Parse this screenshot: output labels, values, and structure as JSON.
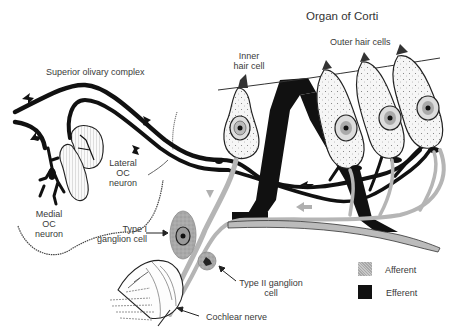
{
  "title": "Organ of Corti",
  "labels": {
    "superior_olivary_complex": "Superior olivary complex",
    "inner_hair_cell_line1": "Inner",
    "inner_hair_cell_line2": "hair cell",
    "outer_hair_cells": "Outer hair cells",
    "lateral_oc_line1": "Lateral",
    "lateral_oc_line2": "OC",
    "lateral_oc_line3": "neuron",
    "medial_oc_line1": "Medial",
    "medial_oc_line2": "OC",
    "medial_oc_line3": "neuron",
    "type1_line1": "Type I",
    "type1_line2": "ganglion cell",
    "type2_line1": "Type II ganglion",
    "type2_line2": "cell",
    "cochlear_nerve": "Cochlear nerve"
  },
  "legend": {
    "items": [
      {
        "label": "Afferent",
        "color": "#b8b8b8"
      },
      {
        "label": "Efferent",
        "color": "#111111"
      }
    ]
  },
  "colors": {
    "efferent": "#111111",
    "afferent": "#b8b8b8",
    "outline": "#222222",
    "cell_fill": "#f4f4f4"
  }
}
